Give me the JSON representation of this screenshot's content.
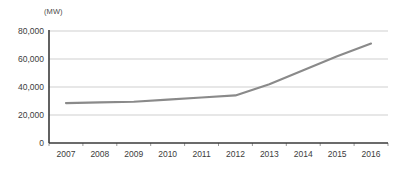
{
  "chart_data": {
    "type": "line",
    "title": "",
    "subtitle": "",
    "unit_label": "(MW)",
    "xlabel": "",
    "ylabel": "",
    "categories": [
      "2007",
      "2008",
      "2009",
      "2010",
      "2011",
      "2012",
      "2013",
      "2014",
      "2015",
      "2016"
    ],
    "values": [
      28500,
      29000,
      29500,
      31000,
      32500,
      34000,
      42000,
      52000,
      62000,
      71000
    ],
    "series": [
      {
        "name": "Capacity",
        "values": [
          28500,
          29000,
          29500,
          31000,
          32500,
          34000,
          42000,
          52000,
          62000,
          71000
        ],
        "color": "#8a8a8a"
      }
    ],
    "ylim": [
      0,
      80000
    ],
    "yticks": [
      0,
      20000,
      40000,
      60000,
      80000
    ],
    "ytick_labels": [
      "0",
      "20,000",
      "40,000",
      "60,000",
      "80,000"
    ],
    "xtick_labels": [
      "2007",
      "2008",
      "2009",
      "2010",
      "2011",
      "2012",
      "2013",
      "2014",
      "2015",
      "2016"
    ],
    "grid": true,
    "grid_color": "#c9c9c9",
    "axis_color": "#3a3a3a",
    "legend": "none",
    "legend_position": "none"
  },
  "axes": {
    "y_axis_name": "y-axis",
    "x_axis_name": "x-axis"
  }
}
